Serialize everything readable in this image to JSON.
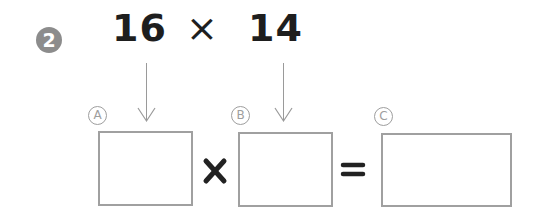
{
  "problem": {
    "number": "2",
    "left_operand": "16",
    "operator": "×",
    "right_operand": "14"
  },
  "boxes": [
    {
      "label": "A",
      "value": ""
    },
    {
      "label": "B",
      "value": ""
    },
    {
      "label": "C",
      "value": ""
    }
  ],
  "equation": {
    "times_sign": "×",
    "equals_sign": "="
  },
  "colors": {
    "badge": "#8c8c8c",
    "text": "#1e1e1e",
    "box_border": "#a0a0a0",
    "label_gray": "#9e9e9e"
  }
}
